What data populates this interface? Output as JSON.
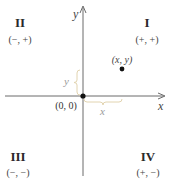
{
  "diagram": {
    "type": "cartesian-coordinate-plane",
    "axes": {
      "x_label": "x",
      "y_label": "y"
    },
    "origin": {
      "label": "(0, 0)"
    },
    "point": {
      "label": "(x, y)"
    },
    "braces": {
      "horizontal_label": "x",
      "vertical_label": "y",
      "color": "#e2d4b0"
    },
    "quadrants": [
      {
        "numeral": "I",
        "signs": "(+, +)"
      },
      {
        "numeral": "II",
        "signs": "(−, +)"
      },
      {
        "numeral": "III",
        "signs": "(−, −)"
      },
      {
        "numeral": "IV",
        "signs": "(+, −)"
      }
    ],
    "colors": {
      "axis": "#666666",
      "point": "#111111",
      "text": "#2a2a2a"
    }
  }
}
